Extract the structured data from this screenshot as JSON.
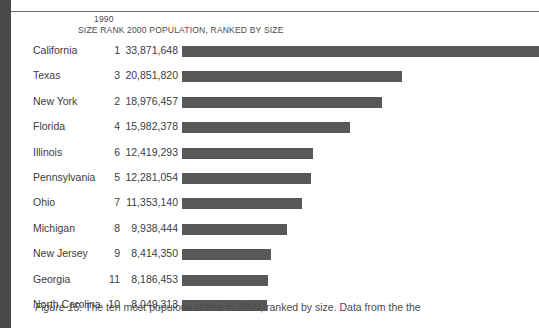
{
  "figure": {
    "label": "Figure 15",
    "caption_text": ": The ten most populous states in 2000, ranked by size. Data from the the"
  },
  "header": {
    "year": "1990",
    "size_rank": "SIZE RANK",
    "population_header": "2000 POPULATION, RANKED BY SIZE"
  },
  "colors": {
    "bar": "#585858",
    "text": "#3c3c3c",
    "gutter": "#4a4a4a",
    "rule": "#6e6e6e"
  },
  "chart_data": {
    "type": "bar",
    "orientation": "horizontal",
    "title": "2000 POPULATION, RANKED BY SIZE",
    "xlabel": "",
    "ylabel": "",
    "grid": false,
    "legend": "none",
    "xlim": [
      0,
      33871648
    ],
    "categories": [
      "California",
      "Texas",
      "New York",
      "Florida",
      "Illinois",
      "Pennsylvania",
      "Ohio",
      "Michigan",
      "New Jersey",
      "Georgia",
      "North Carolina"
    ],
    "values": [
      33871648,
      20851820,
      18976457,
      15982378,
      12419293,
      12281054,
      11353140,
      9938444,
      8414350,
      8186453,
      8049313
    ],
    "value_labels": [
      "33,871,648",
      "20,851,820",
      "18,976,457",
      "15,982,378",
      "12,419,293",
      "12,281,054",
      "11,353,140",
      "9,938,444",
      "8,414,350",
      "8,186,453",
      "8,049,313"
    ],
    "size_rank_1990": [
      "1",
      "3",
      "2",
      "4",
      "6",
      "5",
      "7",
      "8",
      "9",
      "11",
      "10"
    ]
  },
  "rows": [
    {
      "state": "California",
      "rank": "1",
      "population": "33,871,648",
      "value": 33871648
    },
    {
      "state": "Texas",
      "rank": "3",
      "population": "20,851,820",
      "value": 20851820
    },
    {
      "state": "New York",
      "rank": "2",
      "population": "18,976,457",
      "value": 18976457
    },
    {
      "state": "Florida",
      "rank": "4",
      "population": "15,982,378",
      "value": 15982378
    },
    {
      "state": "Illinois",
      "rank": "6",
      "population": "12,419,293",
      "value": 12419293
    },
    {
      "state": "Pennsylvania",
      "rank": "5",
      "population": "12,281,054",
      "value": 12281054
    },
    {
      "state": "Ohio",
      "rank": "7",
      "population": "11,353,140",
      "value": 11353140
    },
    {
      "state": "Michigan",
      "rank": "8",
      "population": "9,938,444",
      "value": 9938444
    },
    {
      "state": "New Jersey",
      "rank": "9",
      "population": "8,414,350",
      "value": 8414350
    },
    {
      "state": "Georgia",
      "rank": "11",
      "population": "8,186,453",
      "value": 8186453
    },
    {
      "state": "North Carolina",
      "rank": "10",
      "population": "8,049,313",
      "value": 8049313
    }
  ]
}
